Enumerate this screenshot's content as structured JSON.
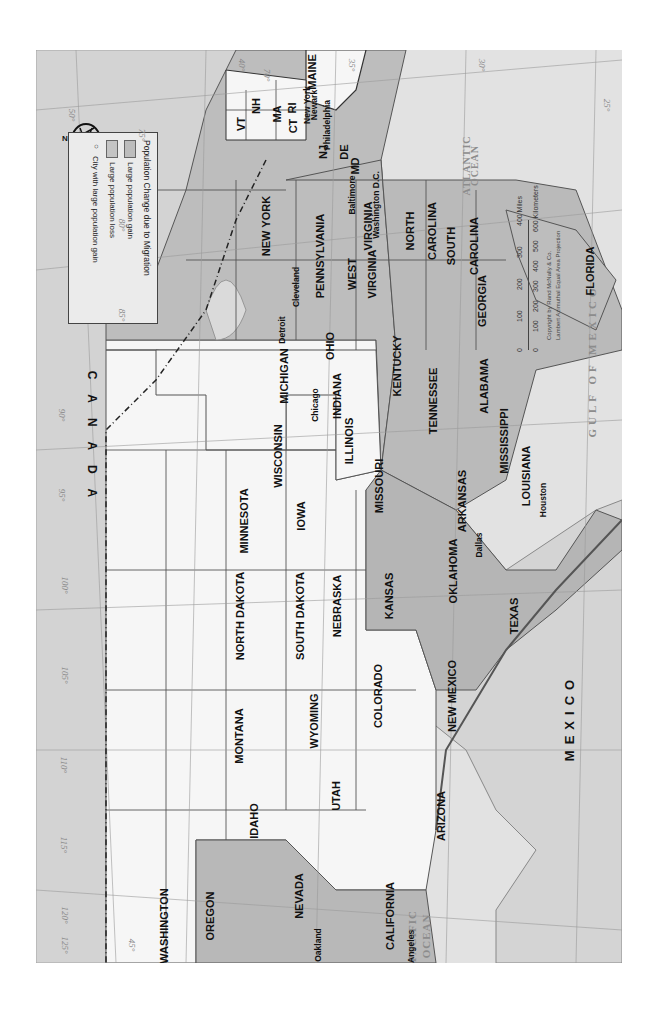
{
  "map": {
    "title": "Population Change due to Migration",
    "orientation": "rotated 90° (north points left)",
    "colors": {
      "background_ocean": "#e2e2e2",
      "gain": "#b9b9b9",
      "loss": "#b9b9b9",
      "neutral_state": "#f6f6f6",
      "foreign_land": "#d2d2d2",
      "border": "#555555"
    },
    "legend": {
      "title": "Population Change due to Migration",
      "items": [
        {
          "label": "Large population gain",
          "swatch": "#bdbdbd"
        },
        {
          "label": "Large population loss",
          "swatch": "#c4c4c4"
        },
        {
          "label": "City with large population gain",
          "symbol": "○"
        }
      ]
    },
    "countries": {
      "canada": "C A N A D A",
      "mexico": "MEXICO"
    },
    "oceans": {
      "atlantic": [
        "ATLANTIC",
        "OCEAN"
      ],
      "pacific": [
        "PACIFIC",
        "OCEAN"
      ],
      "gulf": "GULF OF MEXICO"
    },
    "states": {
      "maine": "MAINE",
      "vt": "VT",
      "nh": "NH",
      "ma": "MA",
      "ct": "CT",
      "ri": "RI",
      "nj": "NJ",
      "de": "DE",
      "md": "MD",
      "new_york": "NEW YORK",
      "pennsylvania": "PENNSYLVANIA",
      "virginia": "VIRGINIA",
      "west_virginia": [
        "WEST",
        "VIRGINIA"
      ],
      "north_carolina": [
        "NORTH",
        "CAROLINA"
      ],
      "south_carolina": [
        "SOUTH",
        "CAROLINA"
      ],
      "georgia": "GEORGIA",
      "florida": "FLORIDA",
      "ohio": "OHIO",
      "michigan": "MICHIGAN",
      "indiana": "INDIANA",
      "kentucky": "KENTUCKY",
      "tennessee": "TENNESSEE",
      "alabama": "ALABAMA",
      "mississippi": "MISSISSIPPI",
      "louisiana": "LOUISIANA",
      "illinois": "ILLINOIS",
      "wisconsin": "WISCONSIN",
      "minnesota": "MINNESOTA",
      "iowa": "IOWA",
      "missouri": "MISSOURI",
      "arkansas": "ARKANSAS",
      "north_dakota": "NORTH DAKOTA",
      "south_dakota": "SOUTH DAKOTA",
      "nebraska": "NEBRASKA",
      "kansas": "KANSAS",
      "oklahoma": "OKLAHOMA",
      "texas": "TEXAS",
      "montana": "MONTANA",
      "wyoming": "WYOMING",
      "colorado": "COLORADO",
      "new_mexico": "NEW MEXICO",
      "idaho": "IDAHO",
      "utah": "UTAH",
      "arizona": "ARIZONA",
      "washington": "WASHINGTON",
      "oregon": "OREGON",
      "nevada": "NEVADA",
      "california": "CALIFORNIA"
    },
    "cities": {
      "new_york": "New York",
      "newark": "Newark",
      "philadelphia": "Philadelphia",
      "baltimore": "Baltimore",
      "washington_dc": "Washington D.C.",
      "cleveland": "Cleveland",
      "detroit": "Detroit",
      "chicago": "Chicago",
      "dallas": "Dallas",
      "houston": "Houston",
      "oakland": "Oakland",
      "los_angeles": "Los Angeles"
    },
    "lakes": {
      "superior": "Lake Superior",
      "michigan": "Lake Michigan",
      "huron": "Lake Huron",
      "erie": "Lake Erie",
      "ontario": "Lake Ontario"
    },
    "scale": {
      "miles_ticks": [
        "0",
        "100",
        "200",
        "300",
        "400 Miles"
      ],
      "km_ticks": [
        "0",
        "100",
        "200",
        "300",
        "400",
        "500",
        "600 Kilometers"
      ],
      "credit": "Copyright by Rand McNally & Co.",
      "projection": "Lambert Azimuthal Equal Area Projection"
    },
    "compass": {
      "label": "N"
    },
    "graticule": {
      "longitudes": [
        "70°",
        "75°",
        "80°",
        "85°",
        "90°",
        "95°",
        "100°",
        "105°",
        "110°",
        "115°",
        "120°",
        "125°"
      ],
      "latitudes": [
        "25°",
        "30°",
        "35°",
        "40°",
        "45°",
        "50°"
      ]
    }
  }
}
